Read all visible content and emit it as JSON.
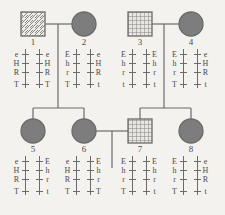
{
  "diagram": {
    "type": "pedigree-chart",
    "background_color": "#f4f2ee",
    "line_color": "#6b6b6b",
    "text_color": "#4a4a4a",
    "affected_fill_color": "#7d7d7d",
    "loci": [
      "E/e",
      "H/h",
      "R/r",
      "T/t"
    ],
    "generations": 2,
    "individuals": [
      {
        "id": "1",
        "label": "1",
        "sex": "male",
        "shape": "square",
        "fill": "diagonal-hatch",
        "generation": 1,
        "x": 21,
        "y": 12,
        "size": 24,
        "genotype": {
          "left": [
            "e",
            "H",
            "R",
            "T"
          ],
          "right": [
            "e",
            "H",
            "R",
            "T"
          ]
        }
      },
      {
        "id": "2",
        "label": "2",
        "sex": "female",
        "shape": "circle",
        "fill": "solid",
        "generation": 1,
        "cx": 84,
        "cy": 24,
        "r": 12,
        "genotype": {
          "left": [
            "E",
            "h",
            "r",
            "T"
          ],
          "right": [
            "e",
            "H",
            "R",
            "t"
          ]
        }
      },
      {
        "id": "3",
        "label": "3",
        "sex": "male",
        "shape": "square",
        "fill": "cross-hatch",
        "generation": 1,
        "x": 128,
        "y": 12,
        "size": 24,
        "genotype": {
          "left": [
            "E",
            "h",
            "r",
            "t"
          ],
          "right": [
            "E",
            "h",
            "r",
            "t"
          ]
        }
      },
      {
        "id": "4",
        "label": "4",
        "sex": "female",
        "shape": "circle",
        "fill": "solid",
        "generation": 1,
        "cx": 191,
        "cy": 24,
        "r": 12,
        "genotype": {
          "left": [
            "E",
            "h",
            "r",
            "T"
          ],
          "right": [
            "e",
            "H",
            "R",
            "t"
          ]
        }
      },
      {
        "id": "5",
        "label": "5",
        "sex": "female",
        "shape": "circle",
        "fill": "solid",
        "generation": 2,
        "cx": 33,
        "cy": 131,
        "r": 12,
        "genotype": {
          "left": [
            "e",
            "H",
            "R",
            "T"
          ],
          "right": [
            "E",
            "h",
            "r",
            "t"
          ]
        }
      },
      {
        "id": "6",
        "label": "6",
        "sex": "female",
        "shape": "circle",
        "fill": "solid",
        "generation": 2,
        "cx": 84,
        "cy": 131,
        "r": 12,
        "genotype": {
          "left": [
            "e",
            "H",
            "R",
            "T"
          ],
          "right": [
            "E",
            "h",
            "r",
            "T"
          ]
        }
      },
      {
        "id": "7",
        "label": "7",
        "sex": "male",
        "shape": "square",
        "fill": "cross-hatch",
        "generation": 2,
        "x": 128,
        "y": 119,
        "size": 24,
        "genotype": {
          "left": [
            "E",
            "h",
            "r",
            "T"
          ],
          "right": [
            "E",
            "h",
            "r",
            "t"
          ]
        }
      },
      {
        "id": "8",
        "label": "8",
        "sex": "female",
        "shape": "circle",
        "fill": "solid",
        "generation": 2,
        "cx": 191,
        "cy": 131,
        "r": 12,
        "genotype": {
          "left": [
            "E",
            "h",
            "r",
            "T"
          ],
          "right": [
            "e",
            "H",
            "R",
            "t"
          ]
        }
      }
    ],
    "matings": [
      {
        "partners": [
          "1",
          "2"
        ],
        "children": [
          "5",
          "6"
        ]
      },
      {
        "partners": [
          "3",
          "4"
        ],
        "children": [
          "7",
          "8"
        ]
      },
      {
        "partners": [
          "6",
          "7"
        ],
        "children": []
      }
    ]
  }
}
